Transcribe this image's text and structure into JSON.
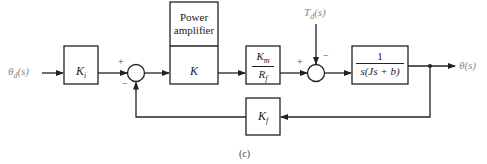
{
  "diagram": {
    "caption": "(c)",
    "input": {
      "label": "θ",
      "sub": "d",
      "arg": "(s)"
    },
    "output": {
      "label": "θ(s)"
    },
    "disturbance": {
      "label": "T",
      "sub": "d",
      "arg": "(s)"
    },
    "blocks": [
      {
        "id": "Ki",
        "main": "K",
        "sub": "i"
      },
      {
        "id": "power-amplifier",
        "header": [
          "Power",
          "amplifier"
        ],
        "main": "K"
      },
      {
        "id": "Km-over-Rf",
        "num_main": "K",
        "num_sub": "m",
        "den_main": "R",
        "den_sub": "f"
      },
      {
        "id": "plant",
        "numerator": "1",
        "denominator": "s(Js + b)"
      },
      {
        "id": "Kf",
        "main": "K",
        "sub": "f"
      }
    ],
    "summing_junctions": [
      {
        "id": "sum1",
        "signs": {
          "left": "+",
          "bottom": "−"
        }
      },
      {
        "id": "sum2",
        "signs": {
          "left": "+",
          "top": "−"
        }
      }
    ],
    "colors": {
      "line": "#222222",
      "label_gray": "#888888"
    }
  }
}
